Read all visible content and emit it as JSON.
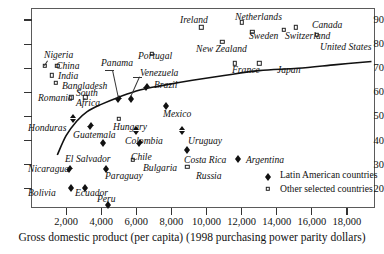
{
  "chart_data": {
    "type": "scatter",
    "title": "",
    "xlabel": "Gross domestic product (per capita) (1998 purchasing power parity dollars)",
    "ylabel": "",
    "xlim": [
      0,
      19600
    ],
    "ylim": [
      12,
      95
    ],
    "grid": false,
    "xticks": [
      2000,
      4000,
      6000,
      8000,
      10000,
      12000,
      14000,
      16000,
      18000
    ],
    "xtick_labels": [
      "2,000",
      "4,000",
      "6,000",
      "8,000",
      "10,000",
      "12,000",
      "14,000",
      "16,000",
      "18,000"
    ],
    "yticks": [
      20,
      30,
      40,
      50,
      60,
      70,
      80,
      90
    ],
    "ytick_labels": [
      "20",
      "30",
      "40",
      "50",
      "60",
      "70",
      "80",
      "90"
    ],
    "legend_position": "bottom-right",
    "series": [
      {
        "name": "Latin American countries",
        "marker": "filled-diamond",
        "color": "#111111",
        "points": [
          {
            "label": "Honduras",
            "x": 2400,
            "y": 50,
            "lx": 28,
            "ly": 123,
            "align": "right"
          },
          {
            "label": "Nicaragua",
            "x": 2200,
            "y": 29,
            "lx": 28,
            "ly": 164,
            "align": "right"
          },
          {
            "label": "Bolivia",
            "x": 2300,
            "y": 21,
            "lx": 28,
            "ly": 188,
            "align": "right"
          },
          {
            "label": "Guatemala",
            "x": 3400,
            "y": 47,
            "lx": 73,
            "ly": 130,
            "align": "left"
          },
          {
            "label": "Ecuador",
            "x": 3100,
            "y": 21,
            "lx": 75,
            "ly": 188,
            "align": "left"
          },
          {
            "label": "El Salvador",
            "x": 4100,
            "y": 40,
            "lx": 65,
            "ly": 154,
            "align": "left"
          },
          {
            "label": "Peru",
            "x": 4400,
            "y": 14,
            "lx": 97,
            "ly": 194,
            "align": "left"
          },
          {
            "label": "Paraguay",
            "x": 4300,
            "y": 29,
            "lx": 105,
            "ly": 171,
            "align": "left"
          },
          {
            "label": "Panama",
            "x": 5000,
            "y": 58,
            "lx": 101,
            "ly": 58,
            "align": "left"
          },
          {
            "label": "Venezuela",
            "x": 5700,
            "y": 58,
            "lx": 140,
            "ly": 68,
            "align": "left"
          },
          {
            "label": "Brazil",
            "x": 6600,
            "y": 63,
            "lx": 154,
            "ly": 80,
            "align": "left"
          },
          {
            "label": "Colombia",
            "x": 6000,
            "y": 45,
            "lx": 125,
            "ly": 136,
            "align": "left"
          },
          {
            "label": "Chile",
            "x": 6200,
            "y": 40,
            "lx": 131,
            "ly": 152,
            "align": "left"
          },
          {
            "label": "Mexico",
            "x": 7700,
            "y": 55,
            "lx": 163,
            "ly": 109,
            "align": "left"
          },
          {
            "label": "Uruguay",
            "x": 8600,
            "y": 45,
            "lx": 188,
            "ly": 136,
            "align": "left"
          },
          {
            "label": "Costa Rica",
            "x": 8900,
            "y": 37,
            "lx": 184,
            "ly": 155,
            "align": "left"
          },
          {
            "label": "Argentina",
            "x": 11800,
            "y": 33,
            "lx": 246,
            "ly": 155,
            "align": "center"
          }
        ]
      },
      {
        "name": "Other selected countries",
        "marker": "open-square",
        "color": "#222222",
        "points": [
          {
            "label": "Nigeria",
            "x": 800,
            "y": 71,
            "lx": 44,
            "ly": 50,
            "align": "left",
            "leader": true
          },
          {
            "label": "China",
            "x": 1500,
            "y": 71,
            "lx": 56,
            "ly": 61,
            "align": "left"
          },
          {
            "label": "India",
            "x": 1200,
            "y": 67,
            "lx": 58,
            "ly": 71,
            "align": "left"
          },
          {
            "label": "Bangladesh",
            "x": 1400,
            "y": 64,
            "lx": 62,
            "ly": 81,
            "align": "left"
          },
          {
            "label": "Romania",
            "x": 2300,
            "y": 58,
            "lx": 38,
            "ly": 93,
            "align": "left"
          },
          {
            "label": "South Africa",
            "x": 3100,
            "y": 58,
            "lx": 76,
            "ly": 88,
            "align": "left"
          },
          {
            "label": "Hungary",
            "x": 5000,
            "y": 49,
            "lx": 113,
            "ly": 122,
            "align": "left"
          },
          {
            "label": "Bulgaria",
            "x": 5800,
            "y": 32,
            "lx": 143,
            "ly": 163,
            "align": "left"
          },
          {
            "label": "Russia",
            "x": 8900,
            "y": 29,
            "lx": 196,
            "ly": 171,
            "align": "left"
          },
          {
            "label": "Portugal",
            "x": 6900,
            "y": 76,
            "lx": 138,
            "ly": 51,
            "align": "left"
          },
          {
            "label": "Ireland",
            "x": 9700,
            "y": 87,
            "lx": 180,
            "ly": 15,
            "align": "left"
          },
          {
            "label": "New Zealand",
            "x": 10900,
            "y": 81,
            "lx": 196,
            "ly": 44,
            "align": "left"
          },
          {
            "label": "Netherlands",
            "x": 12000,
            "y": 89,
            "lx": 235,
            "ly": 12,
            "align": "left"
          },
          {
            "label": "Sweden",
            "x": 12600,
            "y": 85,
            "lx": 249,
            "ly": 31,
            "align": "left"
          },
          {
            "label": "Switzerland",
            "x": 14400,
            "y": 86,
            "lx": 285,
            "ly": 31,
            "align": "left"
          },
          {
            "label": "Canada",
            "x": 15100,
            "y": 87,
            "lx": 312,
            "ly": 20,
            "align": "left"
          },
          {
            "label": "United States",
            "x": 16300,
            "y": 84,
            "lx": 320,
            "ly": 42,
            "align": "left"
          },
          {
            "label": "France",
            "x": 11600,
            "y": 72,
            "lx": 232,
            "ly": 65,
            "align": "left"
          },
          {
            "label": "Japan",
            "x": 13000,
            "y": 72,
            "lx": 277,
            "ly": 65,
            "align": "left"
          }
        ]
      }
    ],
    "trend": {
      "name": "fitted-trend-curve",
      "description": "Logarithmic fit rising from lower-left to upper-right",
      "points": [
        {
          "x": 1500,
          "y": 34
        },
        {
          "x": 2000,
          "y": 42
        },
        {
          "x": 2600,
          "y": 48
        },
        {
          "x": 3200,
          "y": 52
        },
        {
          "x": 4000,
          "y": 55
        },
        {
          "x": 5000,
          "y": 58
        },
        {
          "x": 6200,
          "y": 61
        },
        {
          "x": 7600,
          "y": 63
        },
        {
          "x": 9200,
          "y": 65
        },
        {
          "x": 11000,
          "y": 67
        },
        {
          "x": 13000,
          "y": 69
        },
        {
          "x": 15200,
          "y": 70
        },
        {
          "x": 17400,
          "y": 71.5
        },
        {
          "x": 19400,
          "y": 72.8
        }
      ]
    }
  },
  "legend": {
    "items": [
      {
        "label": "Latin American countries",
        "marker": "filled-diamond"
      },
      {
        "label": "Other selected countries",
        "marker": "open-square"
      }
    ]
  }
}
